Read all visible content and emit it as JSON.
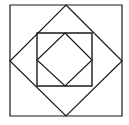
{
  "diagram": {
    "type": "nested-squares",
    "stroke_color": "#1a1a1a",
    "background": "#ffffff",
    "shapes": [
      {
        "name": "outer-square",
        "points": [
          [
            10,
            5
          ],
          [
            122,
            5
          ],
          [
            122,
            116
          ],
          [
            10,
            116
          ]
        ]
      },
      {
        "name": "outer-diamond",
        "points": [
          [
            66,
            5
          ],
          [
            122,
            61
          ],
          [
            66,
            116
          ],
          [
            10,
            61
          ]
        ]
      },
      {
        "name": "inner-square",
        "points": [
          [
            37,
            33
          ],
          [
            92,
            33
          ],
          [
            92,
            86
          ],
          [
            37,
            86
          ]
        ]
      },
      {
        "name": "inner-diamond",
        "points": [
          [
            65,
            33
          ],
          [
            92,
            60
          ],
          [
            65,
            86
          ],
          [
            37,
            60
          ]
        ]
      }
    ]
  }
}
